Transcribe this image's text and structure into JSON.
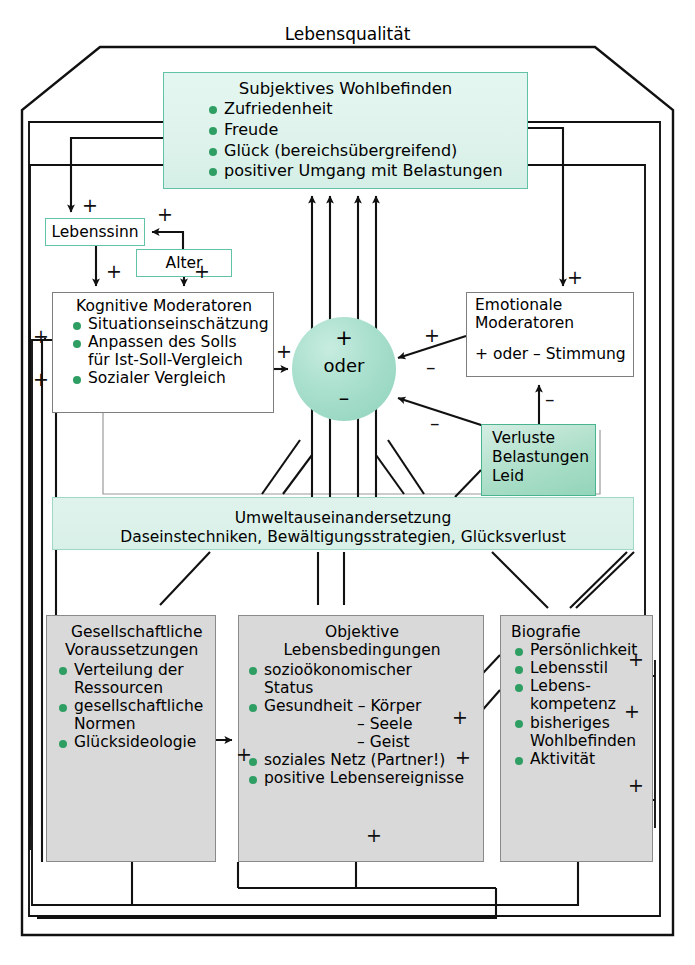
{
  "diagram": {
    "title": "Lebensqualität",
    "nodes": {
      "subjektives_wohlbefinden": {
        "title": "Subjektives Wohlbefinden",
        "items": [
          "Zufriedenheit",
          "Freude",
          "Glück (bereichsübergreifend)",
          "positiver Umgang mit Belastungen"
        ]
      },
      "lebenssinn": {
        "label": "Lebenssinn"
      },
      "alter": {
        "label": "Alter"
      },
      "kognitive_moderatoren": {
        "title": "Kognitive Moderatoren",
        "items": [
          "Situationseinschätzung",
          "Anpassen des Solls",
          "Sozialer Vergleich"
        ],
        "sub_item": "für Ist-Soll-Vergleich"
      },
      "emotionale_moderatoren": {
        "line1": "Emotionale",
        "line2": "Moderatoren",
        "line3": "+ oder – Stimmung"
      },
      "verluste": {
        "line1": "Verluste",
        "line2": "Belastungen",
        "line3": "Leid"
      },
      "center": {
        "plus": "+",
        "label": "oder",
        "minus": "–"
      },
      "umwelt": {
        "line1": "Umweltauseinandersetzung",
        "line2": "Daseinstechniken, Bewältigungsstrategien, Glücksverlust"
      },
      "gesellschaftliche_voraussetzungen": {
        "title_line1": "Gesellschaftliche",
        "title_line2": "Voraussetzungen",
        "items": [
          "Verteilung der",
          "gesellschaftliche",
          "Glücksideologie"
        ],
        "cont1": "Ressourcen",
        "cont2": "Normen"
      },
      "objektive_lebensbedingungen": {
        "title_line1": "Objektive",
        "title_line2": "Lebensbedingungen",
        "items": [
          "sozioökonomischer",
          "Gesundheit  – Körper",
          "soziales Netz (Partner!)",
          "positive Lebensereignisse"
        ],
        "cont_status": "Status",
        "sub_seele": "– Seele",
        "sub_geist": "– Geist"
      },
      "biografie": {
        "title": "Biografie",
        "items": [
          "Persönlichkeit",
          "Lebensstil",
          "Lebens-",
          "bisheriges",
          "Aktivität"
        ],
        "cont_kompetenz": "kompetenz",
        "cont_wohlbefinden": "Wohlbefinden"
      }
    },
    "signs": {
      "plus": "+",
      "minus": "–"
    },
    "edge_labels": [
      {
        "id": "swb-to-lebenssinn",
        "sign": "+"
      },
      {
        "id": "alter-to-lebenssinn",
        "sign": "+"
      },
      {
        "id": "lebenssinn-to-kogmod",
        "sign": "+"
      },
      {
        "id": "alter-to-kogmod",
        "sign": "+"
      },
      {
        "id": "left-in-kogmod-1",
        "sign": "+"
      },
      {
        "id": "left-in-kogmod-2",
        "sign": "+"
      },
      {
        "id": "kogmod-to-circle",
        "sign": "+"
      },
      {
        "id": "swb-to-emomod",
        "sign": "+"
      },
      {
        "id": "emomod-to-circle-plus",
        "sign": "+"
      },
      {
        "id": "emomod-to-circle-minus",
        "sign": "–"
      },
      {
        "id": "verluste-to-emomod",
        "sign": "–"
      },
      {
        "id": "verluste-to-circle",
        "sign": "–"
      },
      {
        "id": "biografie-to-objektiv-1",
        "sign": "+"
      },
      {
        "id": "biografie-to-objektiv-2",
        "sign": "+"
      },
      {
        "id": "left-into-objektiv",
        "sign": "+"
      },
      {
        "id": "bottom-into-objektiv",
        "sign": "+"
      },
      {
        "id": "into-biografie-lebensstil",
        "sign": "+"
      },
      {
        "id": "into-biografie-lebenskompetenz",
        "sign": "+"
      },
      {
        "id": "into-biografie-aktivitaet",
        "sign": "+"
      }
    ],
    "colors": {
      "accent_green": "#2f9e63",
      "teal_border": "#62c2a5",
      "teal_fill": "#dff3ec",
      "verluste_fill": "#93d5ba",
      "grey_fill": "#d9d9d9",
      "grey_border": "#8a8a8a",
      "line": "#111111"
    }
  }
}
